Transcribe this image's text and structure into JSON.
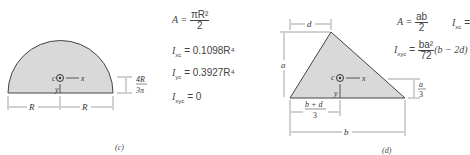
{
  "figures": [
    {
      "id": "c",
      "caption": "(c)",
      "shape": "semicircle",
      "labels": {
        "left_width": "R",
        "right_width": "R",
        "centroid_height_num": "4R",
        "centroid_height_den": "3π",
        "centroid": "c",
        "x_axis": "x",
        "y_axis": "y"
      },
      "formulas": {
        "A_lhs": "A =",
        "A_num": "πR²",
        "A_den": "2",
        "Ixc_lhs": "I",
        "Ixc_sub": "xc",
        "Ixc_rhs": "= 0.1098R⁴",
        "Iyc_lhs": "I",
        "Iyc_sub": "yc",
        "Iyc_rhs": "= 0.3927R⁴",
        "Ixyc_lhs": "I",
        "Ixyc_sub": "xyc",
        "Ixyc_rhs": "= 0"
      }
    },
    {
      "id": "d",
      "caption": "(d)",
      "shape": "triangle",
      "labels": {
        "top_offset": "d",
        "height": "a",
        "base": "b",
        "centroid_x_num": "b + d",
        "centroid_x_den": "3",
        "centroid_y_num": "a",
        "centroid_y_den": "3",
        "centroid": "c",
        "x_axis": "x",
        "y_axis": "y"
      },
      "formulas": {
        "A_lhs": "A =",
        "A_num": "ab",
        "A_den": "2",
        "Ixc_lhs": "I",
        "Ixc_sub": "xc",
        "Ixc_rhs": "=",
        "Ixyc_lhs": "I",
        "Ixyc_sub": "xyc",
        "Ixyc_eq": "=",
        "Ixyc_num": "ba²",
        "Ixyc_den": "72",
        "Ixyc_tail": "(b − 2d)"
      }
    }
  ],
  "colors": {
    "fill": "#d9d9d9",
    "stroke": "#444444",
    "text": "#444444"
  }
}
